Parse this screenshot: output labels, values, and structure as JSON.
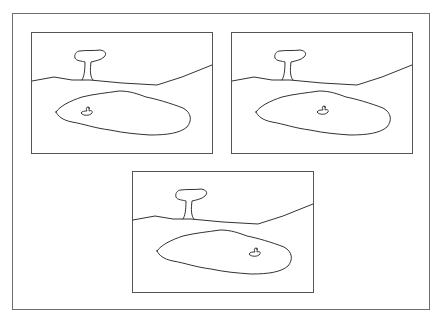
{
  "figure": {
    "colors": {
      "stroke": "#333333",
      "frame": "#6e6e6e",
      "background": "#ffffff"
    },
    "panels": [
      {
        "id": "panel-1",
        "left": 31,
        "top": 32,
        "duck": {
          "x": 55,
          "y": 79
        }
      },
      {
        "id": "panel-2",
        "left": 231,
        "top": 32,
        "duck": {
          "x": 91,
          "y": 78
        }
      },
      {
        "id": "panel-3",
        "left": 132,
        "top": 171,
        "duck": {
          "x": 122,
          "y": 81
        }
      }
    ]
  }
}
